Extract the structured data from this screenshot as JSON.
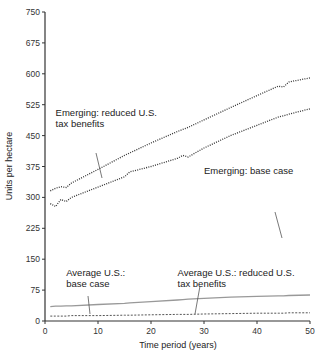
{
  "chart_data": {
    "type": "line",
    "title": "",
    "xlabel": "Time period (years)",
    "ylabel": "Units per hectare",
    "xlim": [
      0,
      50
    ],
    "ylim": [
      0,
      750
    ],
    "xticks": [
      0,
      10,
      20,
      30,
      40,
      50
    ],
    "yticks": [
      0,
      75,
      150,
      225,
      300,
      375,
      450,
      525,
      600,
      675,
      750
    ],
    "grid": false,
    "legend": "none (inline annotations)",
    "x": [
      1,
      2,
      3,
      4,
      5,
      10,
      15,
      16,
      20,
      25,
      26,
      27,
      30,
      35,
      40,
      44,
      45,
      46,
      50
    ],
    "series": [
      {
        "name": "Emerging: reduced U.S. tax benefits",
        "style": "dotted",
        "values": [
          316,
          322,
          326,
          324,
          335,
          368,
          402,
          408,
          432,
          460,
          465,
          470,
          488,
          518,
          547,
          570,
          568,
          580,
          590
        ]
      },
      {
        "name": "Emerging: base case",
        "style": "dotted",
        "values": [
          285,
          278,
          295,
          290,
          300,
          325,
          350,
          362,
          375,
          395,
          402,
          398,
          420,
          450,
          475,
          495,
          498,
          502,
          515
        ]
      },
      {
        "name": "Average U.S.: base case",
        "style": "solid",
        "values": [
          35,
          36,
          36,
          37,
          37,
          40,
          43,
          44,
          47,
          51,
          52,
          53,
          55,
          58,
          60,
          61,
          61,
          62,
          63
        ]
      },
      {
        "name": "Average U.S.: reduced U.S. tax benefits",
        "style": "dashed",
        "values": [
          12,
          12,
          12,
          12,
          13,
          13,
          14,
          14,
          15,
          16,
          16,
          16,
          17,
          18,
          19,
          19,
          19,
          20,
          20
        ]
      }
    ],
    "annotations": [
      {
        "text": [
          "Emerging: reduced U.S.",
          "tax benefits"
        ],
        "x": 2,
        "y": 498
      },
      {
        "text": [
          "Emerging: base case"
        ],
        "x": 30,
        "y": 358
      },
      {
        "text": [
          "Average U.S.:",
          "base case"
        ],
        "x": 4,
        "y": 110
      },
      {
        "text": [
          "Average U.S.: reduced U.S.",
          "tax benefits"
        ],
        "x": 25,
        "y": 110
      }
    ]
  }
}
